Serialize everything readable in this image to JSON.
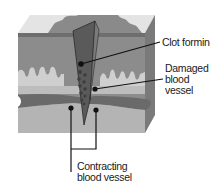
{
  "diagram": {
    "labels": {
      "clot_forming": "Clot forming",
      "damaged_line1": "Damaged",
      "damaged_line2": "blood",
      "damaged_line3": "vessel",
      "contracting_line1": "Contracting",
      "contracting_line2": "blood vessel"
    },
    "colors": {
      "surface_light": "#e4e4e4",
      "surface_dark": "#8a8a8a",
      "epidermis_band": "#6e6e6e",
      "dermis": "#8c8c8c",
      "papillae": "#cfcfcf",
      "lower_dermis": "#bdbdbd",
      "vessel": "#6a6a6a",
      "subcutis": "#b4b4b4",
      "side_face": "#7a7a7a",
      "wound": "#5a5a5a",
      "clot": "#3e3e3e",
      "leader": "#111111"
    }
  }
}
